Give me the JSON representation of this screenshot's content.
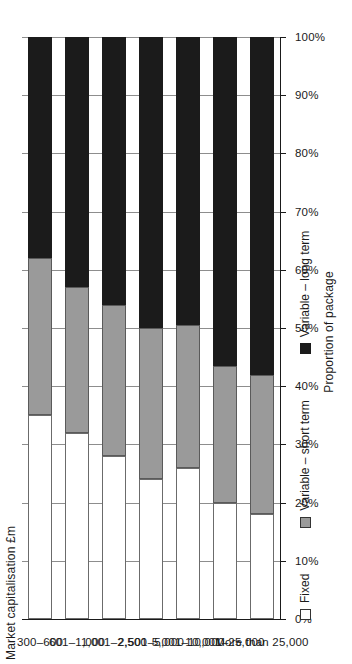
{
  "chart_data": {
    "type": "bar",
    "orientation": "horizontal-stacked",
    "title": "",
    "xlabel": "Proportion of package",
    "ylabel": "Market capitalisation £m",
    "xlim": [
      0,
      100
    ],
    "grid": true,
    "legend_position": "bottom",
    "xtick_labels": [
      "0%",
      "10%",
      "20%",
      "30%",
      "40%",
      "50%",
      "60%",
      "70%",
      "80%",
      "90%",
      "100%"
    ],
    "xtick_values": [
      0,
      10,
      20,
      30,
      40,
      50,
      60,
      70,
      80,
      90,
      100
    ],
    "categories": [
      "300–600",
      "601–1,000",
      "1,001–2,500",
      "2,501–5,000",
      "5,001–10,000",
      "10,001–25,000",
      "More than 25,000"
    ],
    "series": [
      {
        "name": "Fixed",
        "color": "#ffffff",
        "values": [
          35,
          32,
          28,
          24,
          26,
          20,
          18
        ]
      },
      {
        "name": "Variable – short term",
        "color": "#9a9a9a",
        "values": [
          27,
          25,
          26,
          26,
          24.5,
          23.5,
          24
        ]
      },
      {
        "name": "Variable – long term",
        "color": "#1b1b1b",
        "values": [
          38,
          43,
          46,
          50,
          49.5,
          56.5,
          58
        ]
      }
    ]
  },
  "axis": {
    "y_title": "Market capitalisation £m",
    "x_title": "Proportion of package"
  },
  "legend": {
    "items": [
      {
        "label": "Fixed",
        "swatch": "fixed"
      },
      {
        "label": "Variable – short term",
        "swatch": "short"
      },
      {
        "label": "Variable – long term",
        "swatch": "long"
      }
    ]
  }
}
